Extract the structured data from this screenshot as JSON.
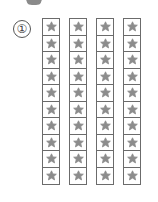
{
  "problem": {
    "number_label": "①",
    "columns": 4,
    "rows_per_column": 10,
    "cell_icon": "star-icon",
    "column_lefts": [
      42,
      69,
      96,
      123
    ],
    "colors": {
      "star": "#8c8c8c",
      "border": "#6b6b6b"
    }
  }
}
